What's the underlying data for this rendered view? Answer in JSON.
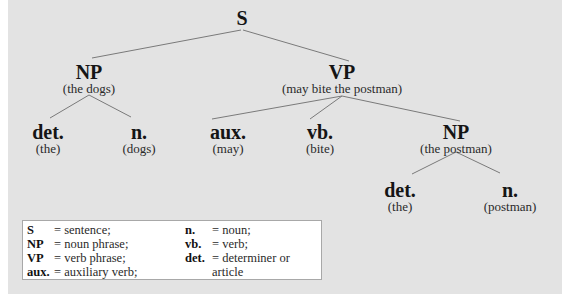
{
  "colors": {
    "panel_background": "#e3e3e3",
    "branch_line": "#7a7a7a",
    "legend_background": "#ffffff",
    "legend_border": "#a8a8a8"
  },
  "tree": {
    "root": {
      "label": "S"
    },
    "np": {
      "label": "NP",
      "sub": "(the dogs)"
    },
    "vp": {
      "label": "VP",
      "sub": "(may bite the postman)"
    },
    "np_det": {
      "label": "det.",
      "sub": "(the)"
    },
    "np_n": {
      "label": "n.",
      "sub": "(dogs)"
    },
    "vp_aux": {
      "label": "aux.",
      "sub": "(may)"
    },
    "vp_vb": {
      "label": "vb.",
      "sub": "(bite)"
    },
    "vp_np": {
      "label": "NP",
      "sub": "(the postman)"
    },
    "vp_np_det": {
      "label": "det.",
      "sub": "(the)"
    },
    "vp_np_n": {
      "label": "n.",
      "sub": "(postman)"
    }
  },
  "edges": [
    [
      "S",
      "NP (the dogs)"
    ],
    [
      "S",
      "VP (may bite the postman)"
    ],
    [
      "NP (the dogs)",
      "det. (the)"
    ],
    [
      "NP (the dogs)",
      "n. (dogs)"
    ],
    [
      "VP (may bite the postman)",
      "aux. (may)"
    ],
    [
      "VP (may bite the postman)",
      "vb. (bite)"
    ],
    [
      "VP (may bite the postman)",
      "NP (the postman)"
    ],
    [
      "NP (the postman)",
      "det. (the)"
    ],
    [
      "NP (the postman)",
      "n. (postman)"
    ]
  ],
  "legend": {
    "left": [
      {
        "key": "S",
        "value": "= sentence;"
      },
      {
        "key": "NP",
        "value": "= noun phrase;"
      },
      {
        "key": "VP",
        "value": "= verb phrase;"
      },
      {
        "key": "aux.",
        "value": "= auxiliary verb;"
      }
    ],
    "right": [
      {
        "key": "n.",
        "value": "= noun;"
      },
      {
        "key": "vb.",
        "value": "= verb;"
      },
      {
        "key": "det.",
        "value": "= determiner or"
      },
      {
        "key": "",
        "value": "article"
      }
    ]
  }
}
